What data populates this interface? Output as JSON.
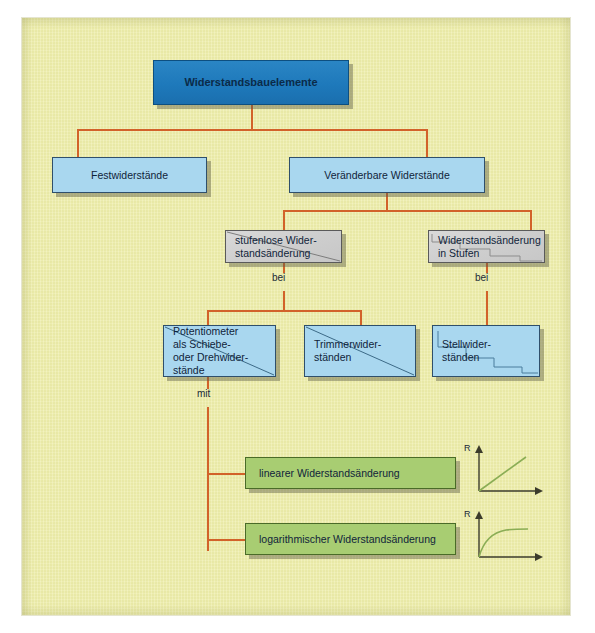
{
  "diagram": {
    "title_node": {
      "label": "Widerstandsbauelemente"
    },
    "level2": [
      {
        "label": "Festwiderstände"
      },
      {
        "label": "Veränderbare Widerstände"
      }
    ],
    "level3": [
      {
        "label": "stufenlose Wider-\nstandsänderung",
        "style": "gray-diagonal"
      },
      {
        "label": "Widerstandsänderung\nin Stufen",
        "style": "gray-steps"
      }
    ],
    "connector_labels": {
      "bei_left": "bei",
      "bei_right": "bei",
      "mit": "mit"
    },
    "level4": [
      {
        "label": "Potentiometer\nals Schiebe-\noder Drehwider-\nstände",
        "style": "blue-diagonal"
      },
      {
        "label": "Trimmerwider-\nständen",
        "style": "blue-diagonal"
      },
      {
        "label": "Stellwider-\nständen",
        "style": "blue-steps"
      }
    ],
    "level5": [
      {
        "label": "linearer Widerstandsänderung"
      },
      {
        "label": "logarithmischer Widerstandsänderung"
      }
    ],
    "plots": [
      {
        "name": "linear-plot",
        "axis_label": "R",
        "curve": "linear"
      },
      {
        "name": "logarithmic-plot",
        "axis_label": "R",
        "curve": "logarithmic"
      }
    ],
    "colors": {
      "background": "#eeeeaa",
      "root_box": "#1e79bb",
      "blue_box": "#a9d7ef",
      "gray_box": "#cfcfcf",
      "green_box": "#a8cd72",
      "connector": "#d2622a",
      "plot_curve": "#8aad55"
    }
  }
}
